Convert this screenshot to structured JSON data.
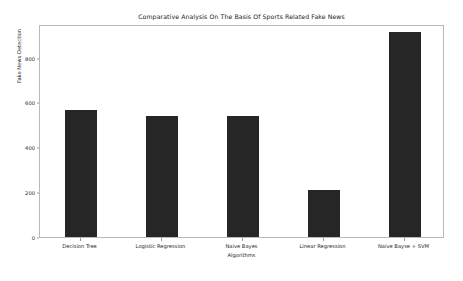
{
  "chart_data": {
    "type": "bar",
    "title": "Comparative Analysis On The Basis Of Sports Related Fake News",
    "xlabel": "Algorithms",
    "ylabel": "Fake News Detection",
    "categories": [
      "Decision Tree",
      "Logistic Regression",
      "Naive Bayes",
      "Linear Regression",
      "Naive Bayse + SVM"
    ],
    "values": [
      567,
      540,
      540,
      210,
      914
    ],
    "ylim": [
      0,
      950
    ],
    "yticks": [
      0,
      200,
      400,
      600,
      800
    ],
    "ytick_labels": [
      "0",
      "200",
      "400",
      "600",
      "800"
    ],
    "grid": false,
    "legend": null,
    "bar_color": "#262626",
    "axes_color": "#b9b9b9",
    "background_color": "#ffffff"
  }
}
